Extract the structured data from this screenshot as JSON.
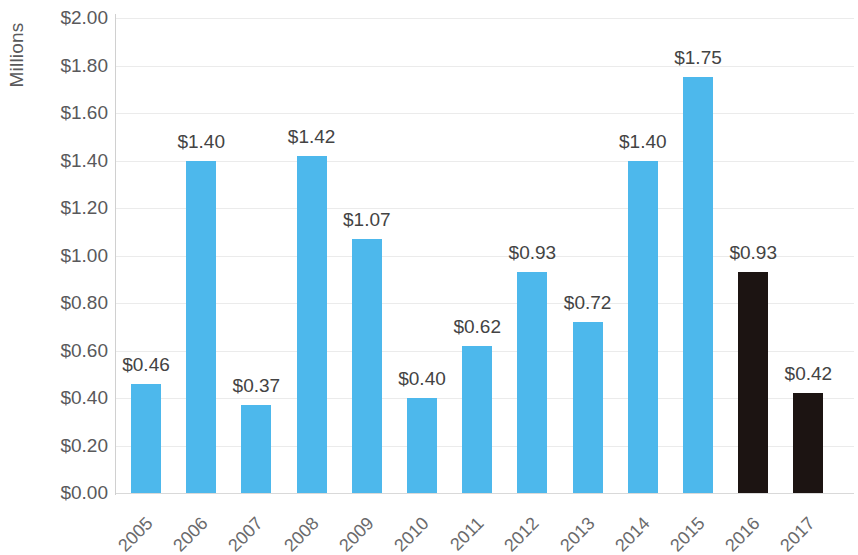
{
  "chart_data": {
    "type": "bar",
    "title": "",
    "subtitle": "",
    "xlabel": "",
    "ylabel": "Millions",
    "categories": [
      "2005",
      "2006",
      "2007",
      "2008",
      "2009",
      "2010",
      "2011",
      "2012",
      "2013",
      "2014",
      "2015",
      "2016",
      "2017"
    ],
    "values": [
      0.46,
      1.4,
      0.37,
      1.42,
      1.07,
      0.4,
      0.62,
      0.93,
      0.72,
      1.4,
      1.75,
      0.93,
      0.42
    ],
    "data_labels": [
      "$0.46",
      "$1.40",
      "$0.37",
      "$1.42",
      "$1.07",
      "$0.40",
      "$0.62",
      "$0.93",
      "$0.72",
      "$1.40",
      "$1.75",
      "$0.93",
      "$0.42"
    ],
    "bar_colors": [
      "#4db8ec",
      "#4db8ec",
      "#4db8ec",
      "#4db8ec",
      "#4db8ec",
      "#4db8ec",
      "#4db8ec",
      "#4db8ec",
      "#4db8ec",
      "#4db8ec",
      "#4db8ec",
      "#1c1412",
      "#1c1412"
    ],
    "ylim": [
      0,
      2.0
    ],
    "ytick_values": [
      0,
      0.2,
      0.4,
      0.6,
      0.8,
      1.0,
      1.2,
      1.4,
      1.6,
      1.8,
      2.0
    ],
    "ytick_labels": [
      "$0.00",
      "$0.20",
      "$0.40",
      "$0.60",
      "$0.80",
      "$1.00",
      "$1.20",
      "$1.40",
      "$1.60",
      "$1.80",
      "$2.00"
    ],
    "grid": true,
    "legend": false,
    "legend_position": "none",
    "series": [
      {
        "name": "Millions",
        "values": [
          0.46,
          1.4,
          0.37,
          1.42,
          1.07,
          0.4,
          0.62,
          0.93,
          0.72,
          1.4,
          1.75,
          0.93,
          0.42
        ]
      }
    ],
    "colors": {
      "primary_bar": "#4db8ec",
      "highlight_bar": "#1c1412",
      "gridline": "#ebebeb",
      "axis_text": "#59595b",
      "data_label_text": "#434343"
    }
  }
}
